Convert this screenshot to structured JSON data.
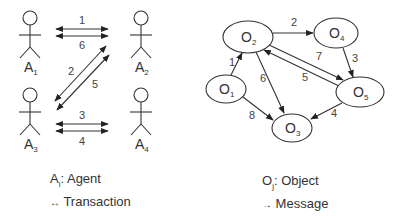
{
  "left_diagram": {
    "agents": [
      {
        "id": "A1",
        "base": "A",
        "sub": "1",
        "x": 30,
        "y": 18
      },
      {
        "id": "A2",
        "base": "A",
        "sub": "2",
        "x": 141,
        "y": 18
      },
      {
        "id": "A3",
        "base": "A",
        "sub": "3",
        "x": 30,
        "y": 95
      },
      {
        "id": "A4",
        "base": "A",
        "sub": "4",
        "x": 141,
        "y": 95
      }
    ],
    "transactions": [
      {
        "label": "1",
        "from": "A1",
        "to": "A2"
      },
      {
        "label": "6",
        "from": "A2",
        "to": "A1"
      },
      {
        "label": "2",
        "from": "A2",
        "to": "A3"
      },
      {
        "label": "5",
        "from": "A3",
        "to": "A2"
      },
      {
        "label": "3",
        "from": "A3",
        "to": "A4"
      },
      {
        "label": "4",
        "from": "A4",
        "to": "A3"
      }
    ]
  },
  "right_diagram": {
    "objects": [
      {
        "id": "O1",
        "base": "O",
        "sub": "1",
        "cx": 226,
        "cy": 89
      },
      {
        "id": "O2",
        "base": "O",
        "sub": "2",
        "cx": 248,
        "cy": 37
      },
      {
        "id": "O3",
        "base": "O",
        "sub": "3",
        "cx": 292,
        "cy": 128
      },
      {
        "id": "O4",
        "base": "O",
        "sub": "4",
        "cx": 336,
        "cy": 33
      },
      {
        "id": "O5",
        "base": "O",
        "sub": "5",
        "cx": 360,
        "cy": 92
      }
    ],
    "messages": [
      {
        "label": "1",
        "from": "O1",
        "to": "O2"
      },
      {
        "label": "2",
        "from": "O2",
        "to": "O4"
      },
      {
        "label": "3",
        "from": "O4",
        "to": "O5"
      },
      {
        "label": "4",
        "from": "O5",
        "to": "O3"
      },
      {
        "label": "5",
        "from": "O5",
        "to": "O2"
      },
      {
        "label": "6",
        "from": "O2",
        "to": "O3"
      },
      {
        "label": "7",
        "from": "O2",
        "to": "O5"
      },
      {
        "label": "8",
        "from": "O1",
        "to": "O3"
      }
    ]
  },
  "legend_left": {
    "agent_symbol": "A",
    "agent_sub": "i",
    "agent_text": ": Agent",
    "transaction_symbol": "↔",
    "transaction_text": " Transaction"
  },
  "legend_right": {
    "object_symbol": "O",
    "object_sub": "j",
    "object_text": ": Object",
    "message_symbol": "→",
    "message_text": " Message"
  }
}
